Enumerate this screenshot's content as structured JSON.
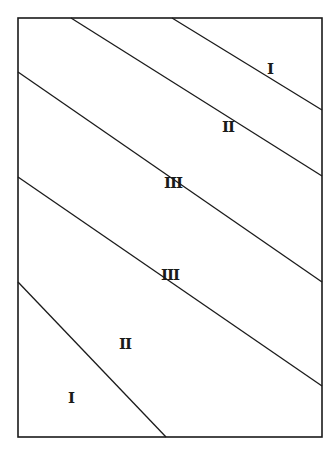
{
  "diagram": {
    "type": "rectangle divided by parallel diagonal lines into zones",
    "stroke_color": "#1a1a1a",
    "background_color": "#ffffff",
    "frame": {
      "x1": 18,
      "y1": 18,
      "x2": 322,
      "y2": 437
    },
    "diagonals": [
      {
        "from": [
          71,
          18
        ],
        "to": [
          322,
          176
        ]
      },
      {
        "from": [
          172,
          18
        ],
        "to": [
          322,
          110
        ]
      },
      {
        "from": [
          18,
          72
        ],
        "to": [
          322,
          282
        ]
      },
      {
        "from": [
          18,
          177
        ],
        "to": [
          322,
          386
        ]
      },
      {
        "from": [
          18,
          282
        ],
        "to": [
          266,
          437
        ]
      },
      {
        "from": [
          18,
          282
        ],
        "to": [
          166,
          437
        ]
      }
    ],
    "zones": [
      {
        "label": "I",
        "x": 270,
        "y": 69
      },
      {
        "label": "II",
        "x": 228,
        "y": 127
      },
      {
        "label": "III",
        "x": 173,
        "y": 183
      },
      {
        "label": "III",
        "x": 170,
        "y": 275
      },
      {
        "label": "II",
        "x": 125,
        "y": 344
      },
      {
        "label": "I",
        "x": 71,
        "y": 398
      }
    ]
  }
}
